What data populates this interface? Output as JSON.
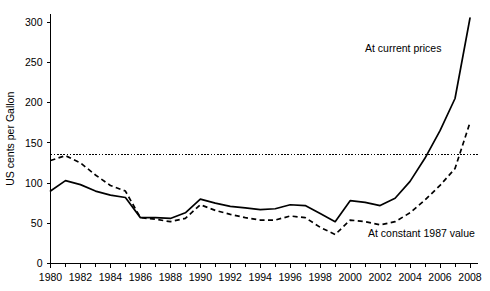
{
  "chart_data": {
    "type": "line",
    "title": "",
    "subtitle": "",
    "xlabel": "",
    "ylabel": "US cents per Gallon",
    "xlim": [
      1980,
      2008
    ],
    "ylim": [
      0,
      310
    ],
    "yticks": [
      0,
      50,
      100,
      150,
      200,
      250,
      300
    ],
    "ytick_labels": [
      "0",
      "50",
      "100",
      "150",
      "200",
      "250",
      "300"
    ],
    "xticks": [
      1980,
      1982,
      1984,
      1986,
      1988,
      1990,
      1992,
      1994,
      1996,
      1998,
      2000,
      2002,
      2004,
      2006,
      2008
    ],
    "xtick_labels": [
      "1980",
      "1982",
      "1984",
      "1986",
      "1988",
      "1990",
      "1992",
      "1994",
      "1996",
      "1998",
      "2000",
      "2002",
      "2004",
      "2006",
      "2008"
    ],
    "x_minor_ticks": [
      1981,
      1983,
      1985,
      1987,
      1989,
      1991,
      1993,
      1995,
      1997,
      1999,
      2001,
      2003,
      2005,
      2007
    ],
    "grid": false,
    "legend_position": "inline-annotations",
    "x": [
      1980,
      1981,
      1982,
      1983,
      1984,
      1985,
      1986,
      1987,
      1988,
      1989,
      1990,
      1991,
      1992,
      1993,
      1994,
      1995,
      1996,
      1997,
      1998,
      1999,
      2000,
      2001,
      2002,
      2003,
      2004,
      2005,
      2006,
      2007,
      2008
    ],
    "series": [
      {
        "name": "At current prices",
        "style": "solid",
        "color": "#000000",
        "values": [
          90,
          103,
          98,
          90,
          85,
          82,
          57,
          57,
          56,
          63,
          80,
          75,
          71,
          69,
          67,
          68,
          73,
          72,
          62,
          52,
          78,
          76,
          72,
          81,
          102,
          131,
          165,
          205,
          305
        ]
      },
      {
        "name": "At constant 1987 value",
        "style": "dashed",
        "color": "#000000",
        "values": [
          128,
          134,
          125,
          110,
          97,
          90,
          57,
          55,
          52,
          56,
          73,
          66,
          61,
          57,
          54,
          54,
          59,
          57,
          45,
          36,
          54,
          52,
          48,
          52,
          63,
          79,
          97,
          118,
          175
        ]
      }
    ],
    "reference_line": {
      "name": "reference-line-135",
      "value": 135,
      "style": "dotted",
      "color": "#000000"
    },
    "annotations": [
      {
        "name": "annotation-at-current-prices",
        "text": "At current prices",
        "x_px": 365,
        "y_px": 52
      },
      {
        "name": "annotation-at-constant-1987-value",
        "text": "At constant 1987 value",
        "x_px": 368,
        "y_px": 237
      }
    ]
  }
}
